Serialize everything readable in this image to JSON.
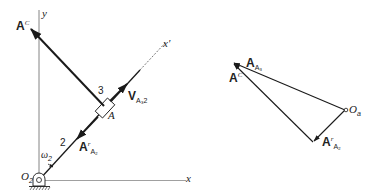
{
  "figure": {
    "left_diagram": {
      "axis_y_label": "y",
      "axis_x_label": "x",
      "link_axis_label": "x′",
      "pivot_label_main": "O",
      "pivot_label_sub": "2",
      "link_number": "2",
      "slider_number": "3",
      "slider_point_label": "A",
      "omega_main": "ω",
      "omega_sub": "2",
      "coriolis_vector": {
        "main": "A",
        "sup": "C"
      },
      "velocity_vector": {
        "main": "V",
        "sub": "A₃2"
      },
      "relative_accel_vector": {
        "main": "A",
        "sup": "r",
        "sub": "A₂"
      }
    },
    "right_diagram": {
      "origin_label_main": "O",
      "origin_label_sub": "a",
      "total_accel_vector": {
        "main": "A",
        "sub": "A₃"
      },
      "coriolis_vector": {
        "main": "A",
        "sup": "C"
      },
      "relative_accel_vector": {
        "main": "A",
        "sup": "r",
        "sub": "A₂"
      }
    },
    "colors": {
      "line": "#1a1a1a",
      "axis": "#555555",
      "background": "#ffffff"
    }
  }
}
